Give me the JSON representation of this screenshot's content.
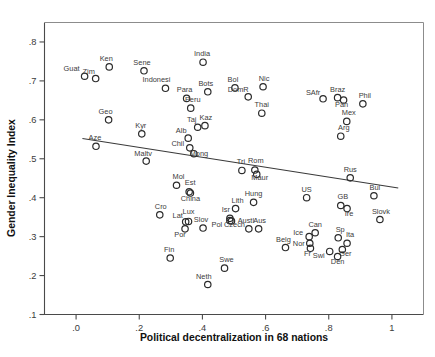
{
  "chart_data": {
    "type": "scatter",
    "title": "",
    "xlabel": "Political decentralization in 68 nations",
    "ylabel": "Gender Inequality Index",
    "xlim": [
      -0.1,
      1.1
    ],
    "ylim": [
      0.1,
      0.85
    ],
    "xticks": [
      ".0",
      ".2",
      ".4",
      ".6",
      ".8",
      "1"
    ],
    "xtick_values": [
      0.0,
      0.2,
      0.4,
      0.6,
      0.8,
      1.0
    ],
    "yticks": [
      ".1",
      ".2",
      ".3",
      ".4",
      ".5",
      ".6",
      ".7",
      ".8"
    ],
    "ytick_values": [
      0.1,
      0.2,
      0.3,
      0.4,
      0.5,
      0.6,
      0.7,
      0.8
    ],
    "grid": false,
    "legend": "none",
    "marker_style": "open-circle",
    "n_points": 68,
    "fit_line": {
      "type": "linear-regression",
      "x_start": 0.02,
      "y_start": 0.552,
      "x_end": 1.02,
      "y_end": 0.425
    },
    "points": [
      {
        "label": "Guat",
        "x": 0.027,
        "y": 0.712,
        "lx": -13,
        "ly": -5
      },
      {
        "label": "Zim",
        "x": 0.062,
        "y": 0.706,
        "lx": -7,
        "ly": -5
      },
      {
        "label": "Ken",
        "x": 0.105,
        "y": 0.736,
        "lx": -3,
        "ly": -6
      },
      {
        "label": "Sene",
        "x": 0.215,
        "y": 0.726,
        "lx": -2,
        "ly": -6
      },
      {
        "label": "Indonesi",
        "x": 0.283,
        "y": 0.681,
        "lx": -9,
        "ly": -6
      },
      {
        "label": "India",
        "x": 0.402,
        "y": 0.748,
        "lx": -1,
        "ly": -6
      },
      {
        "label": "Geo",
        "x": 0.103,
        "y": 0.6,
        "lx": -3,
        "ly": -6
      },
      {
        "label": "Kyr",
        "x": 0.208,
        "y": 0.564,
        "lx": -1,
        "ly": -6
      },
      {
        "label": "Aze",
        "x": 0.063,
        "y": 0.532,
        "lx": -1,
        "ly": -6
      },
      {
        "label": "Maltv",
        "x": 0.222,
        "y": 0.494,
        "lx": -3,
        "ly": -5
      },
      {
        "label": "Para",
        "x": 0.35,
        "y": 0.655,
        "lx": -2,
        "ly": -6
      },
      {
        "label": "Peru",
        "x": 0.363,
        "y": 0.63,
        "lx": 2,
        "ly": -6
      },
      {
        "label": "Bots",
        "x": 0.417,
        "y": 0.672,
        "lx": -2,
        "ly": -6
      },
      {
        "label": "Bol",
        "x": 0.503,
        "y": 0.682,
        "lx": -2,
        "ly": -6
      },
      {
        "label": "DomR",
        "x": 0.545,
        "y": 0.659,
        "lx": -10,
        "ly": -5
      },
      {
        "label": "Nic",
        "x": 0.592,
        "y": 0.685,
        "lx": 1,
        "ly": -6
      },
      {
        "label": "Thai",
        "x": 0.588,
        "y": 0.617,
        "lx": 0,
        "ly": -6
      },
      {
        "label": "Taj",
        "x": 0.385,
        "y": 0.581,
        "lx": -6,
        "ly": -5
      },
      {
        "label": "Kaz",
        "x": 0.408,
        "y": 0.585,
        "lx": 1,
        "ly": -6
      },
      {
        "label": "Alb",
        "x": 0.355,
        "y": 0.553,
        "lx": -7,
        "ly": -5
      },
      {
        "label": "Chil",
        "x": 0.36,
        "y": 0.528,
        "lx": -12,
        "ly": -2
      },
      {
        "label": "Mong",
        "x": 0.373,
        "y": 0.513,
        "lx": 5,
        "ly": 2
      },
      {
        "label": "Tri",
        "x": 0.525,
        "y": 0.47,
        "lx": -1,
        "ly": -6
      },
      {
        "label": "Rom",
        "x": 0.566,
        "y": 0.471,
        "lx": 1,
        "ly": -7
      },
      {
        "label": "Maur",
        "x": 0.572,
        "y": 0.46,
        "lx": 3,
        "ly": 6
      },
      {
        "label": "SAfr",
        "x": 0.782,
        "y": 0.654,
        "lx": -10,
        "ly": -4
      },
      {
        "label": "Braz",
        "x": 0.828,
        "y": 0.657,
        "lx": 0,
        "ly": -6
      },
      {
        "label": "Pan",
        "x": 0.847,
        "y": 0.651,
        "lx": -2,
        "ly": 7
      },
      {
        "label": "Phil",
        "x": 0.908,
        "y": 0.641,
        "lx": 2,
        "ly": -6
      },
      {
        "label": "Mex",
        "x": 0.857,
        "y": 0.596,
        "lx": 2,
        "ly": -6
      },
      {
        "label": "Arg",
        "x": 0.838,
        "y": 0.558,
        "lx": 3,
        "ly": -6
      },
      {
        "label": "Rus",
        "x": 0.868,
        "y": 0.451,
        "lx": 0,
        "ly": -6
      },
      {
        "label": "US",
        "x": 0.73,
        "y": 0.4,
        "lx": 0,
        "ly": -6
      },
      {
        "label": "Bul",
        "x": 0.943,
        "y": 0.405,
        "lx": 1,
        "ly": -6
      },
      {
        "label": "GB",
        "x": 0.838,
        "y": 0.38,
        "lx": 2,
        "ly": -6
      },
      {
        "label": "Ire",
        "x": 0.858,
        "y": 0.372,
        "lx": 2,
        "ly": 7
      },
      {
        "label": "Slovk",
        "x": 0.962,
        "y": 0.344,
        "lx": 1,
        "ly": -6
      },
      {
        "label": "Mol",
        "x": 0.318,
        "y": 0.432,
        "lx": 2,
        "ly": -6
      },
      {
        "label": "Est",
        "x": 0.358,
        "y": 0.415,
        "lx": 1,
        "ly": -7
      },
      {
        "label": "China",
        "x": 0.362,
        "y": 0.412,
        "lx": 0,
        "ly": 8
      },
      {
        "label": "Cro",
        "x": 0.265,
        "y": 0.356,
        "lx": 1,
        "ly": -6
      },
      {
        "label": "Lat",
        "x": 0.347,
        "y": 0.338,
        "lx": -8,
        "ly": -4
      },
      {
        "label": "Lux",
        "x": 0.356,
        "y": 0.339,
        "lx": 0,
        "ly": -7
      },
      {
        "label": "Por",
        "x": 0.345,
        "y": 0.32,
        "lx": -5,
        "ly": 8
      },
      {
        "label": "Slov",
        "x": 0.402,
        "y": 0.322,
        "lx": -2,
        "ly": -6
      },
      {
        "label": "Fin",
        "x": 0.298,
        "y": 0.245,
        "lx": -1,
        "ly": -6
      },
      {
        "label": "Neth",
        "x": 0.417,
        "y": 0.177,
        "lx": -4,
        "ly": -6
      },
      {
        "label": "Swe",
        "x": 0.47,
        "y": 0.219,
        "lx": 2,
        "ly": -6
      },
      {
        "label": "Isr",
        "x": 0.487,
        "y": 0.347,
        "lx": -4,
        "ly": -6
      },
      {
        "label": "Pol",
        "x": 0.487,
        "y": 0.341,
        "lx": -13,
        "ly": 6
      },
      {
        "label": "Czech",
        "x": 0.492,
        "y": 0.34,
        "lx": 3,
        "ly": 6
      },
      {
        "label": "Lith",
        "x": 0.505,
        "y": 0.372,
        "lx": 2,
        "ly": -6
      },
      {
        "label": "Hung",
        "x": 0.562,
        "y": 0.388,
        "lx": 0,
        "ly": -6
      },
      {
        "label": "Austl",
        "x": 0.547,
        "y": 0.32,
        "lx": -3,
        "ly": -6
      },
      {
        "label": "Aus",
        "x": 0.578,
        "y": 0.32,
        "lx": 1,
        "ly": -6
      },
      {
        "label": "Belg",
        "x": 0.663,
        "y": 0.272,
        "lx": -2,
        "ly": -6
      },
      {
        "label": "Can",
        "x": 0.757,
        "y": 0.31,
        "lx": 0,
        "ly": -6
      },
      {
        "label": "Ice",
        "x": 0.738,
        "y": 0.3,
        "lx": -11,
        "ly": -2
      },
      {
        "label": "Nor",
        "x": 0.74,
        "y": 0.283,
        "lx": -11,
        "ly": 3
      },
      {
        "label": "Fr",
        "x": 0.742,
        "y": 0.27,
        "lx": -3,
        "ly": 8
      },
      {
        "label": "Sp",
        "x": 0.83,
        "y": 0.297,
        "lx": 2,
        "ly": -6
      },
      {
        "label": "Ita",
        "x": 0.858,
        "y": 0.283,
        "lx": 3,
        "ly": -6
      },
      {
        "label": "Ger",
        "x": 0.843,
        "y": 0.267,
        "lx": 3,
        "ly": 7
      },
      {
        "label": "Swi",
        "x": 0.803,
        "y": 0.262,
        "lx": -11,
        "ly": 7
      },
      {
        "label": "Den",
        "x": 0.828,
        "y": 0.249,
        "lx": 0,
        "ly": 8
      }
    ]
  }
}
